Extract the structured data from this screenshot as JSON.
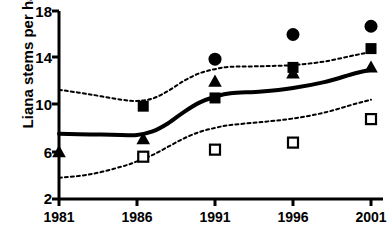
{
  "chart_data": {
    "type": "scatter",
    "title": "",
    "xlabel": "",
    "ylabel": "Liana stems per ha",
    "x": [
      1981,
      1986,
      1991,
      1996,
      2001
    ],
    "xtick_labels": [
      "1981",
      "1986",
      "1991",
      "1996",
      "2001"
    ],
    "ytick_labels": [
      "2",
      "6",
      "10",
      "14",
      "18"
    ],
    "yticks": [
      2,
      6,
      10,
      14,
      18
    ],
    "xlim": [
      1981,
      2001
    ],
    "ylim": [
      2,
      18
    ],
    "grid": false,
    "legend": "none",
    "series": [
      {
        "name": "filled-circle",
        "marker": "filled-circle",
        "color": "#000000",
        "points": [
          {
            "x": 1991,
            "y": 13.9
          },
          {
            "x": 1996,
            "y": 16.0
          },
          {
            "x": 2001,
            "y": 16.7
          }
        ]
      },
      {
        "name": "filled-square",
        "marker": "filled-square",
        "color": "#000000",
        "points": [
          {
            "x": 1986.4,
            "y": 9.9
          },
          {
            "x": 1991,
            "y": 10.6
          },
          {
            "x": 1996,
            "y": 13.2
          },
          {
            "x": 2001,
            "y": 14.8
          }
        ]
      },
      {
        "name": "filled-triangle",
        "marker": "filled-triangle",
        "color": "#000000",
        "points": [
          {
            "x": 1981,
            "y": 6.0
          },
          {
            "x": 1986.4,
            "y": 7.1
          },
          {
            "x": 1991,
            "y": 12.0
          },
          {
            "x": 1996,
            "y": 12.7
          },
          {
            "x": 2001,
            "y": 13.2
          }
        ]
      },
      {
        "name": "open-square",
        "marker": "open-square",
        "color": "#000000",
        "points": [
          {
            "x": 1986.4,
            "y": 5.6
          },
          {
            "x": 1991,
            "y": 6.2
          },
          {
            "x": 1996,
            "y": 6.8
          },
          {
            "x": 2001,
            "y": 8.8
          }
        ]
      }
    ],
    "trend_line": {
      "name": "fitted-trend",
      "style": "solid",
      "color": "#000000",
      "values": [
        {
          "x": 1981.0,
          "y": 7.55
        },
        {
          "x": 1983.0,
          "y": 7.5
        },
        {
          "x": 1985.0,
          "y": 7.45
        },
        {
          "x": 1986.0,
          "y": 7.45
        },
        {
          "x": 1987.0,
          "y": 7.75
        },
        {
          "x": 1988.0,
          "y": 8.45
        },
        {
          "x": 1989.0,
          "y": 9.4
        },
        {
          "x": 1990.0,
          "y": 10.2
        },
        {
          "x": 1991.0,
          "y": 10.7
        },
        {
          "x": 1992.0,
          "y": 11.0
        },
        {
          "x": 1994.0,
          "y": 11.15
        },
        {
          "x": 1996.0,
          "y": 11.45
        },
        {
          "x": 1998.0,
          "y": 11.95
        },
        {
          "x": 2000.0,
          "y": 12.7
        },
        {
          "x": 2001.0,
          "y": 13.0
        }
      ]
    },
    "confidence_bands": [
      {
        "name": "upper-confidence-band",
        "style": "dotted",
        "color": "#000000",
        "values": [
          {
            "x": 1981.0,
            "y": 11.3
          },
          {
            "x": 1983.0,
            "y": 10.9
          },
          {
            "x": 1985.0,
            "y": 10.45
          },
          {
            "x": 1986.0,
            "y": 10.35
          },
          {
            "x": 1987.0,
            "y": 10.55
          },
          {
            "x": 1988.0,
            "y": 11.2
          },
          {
            "x": 1989.0,
            "y": 12.05
          },
          {
            "x": 1990.0,
            "y": 12.7
          },
          {
            "x": 1991.0,
            "y": 13.05
          },
          {
            "x": 1992.0,
            "y": 13.25
          },
          {
            "x": 1994.0,
            "y": 13.3
          },
          {
            "x": 1996.0,
            "y": 13.4
          },
          {
            "x": 1998.0,
            "y": 13.7
          },
          {
            "x": 2000.0,
            "y": 14.25
          },
          {
            "x": 2001.0,
            "y": 14.5
          }
        ]
      },
      {
        "name": "lower-confidence-band",
        "style": "dotted",
        "color": "#000000",
        "values": [
          {
            "x": 1981.0,
            "y": 3.8
          },
          {
            "x": 1983.0,
            "y": 4.1
          },
          {
            "x": 1985.0,
            "y": 4.75
          },
          {
            "x": 1986.0,
            "y": 5.2
          },
          {
            "x": 1987.0,
            "y": 5.75
          },
          {
            "x": 1988.0,
            "y": 6.45
          },
          {
            "x": 1989.0,
            "y": 7.15
          },
          {
            "x": 1990.0,
            "y": 7.7
          },
          {
            "x": 1991.0,
            "y": 8.05
          },
          {
            "x": 1992.0,
            "y": 8.3
          },
          {
            "x": 1994.0,
            "y": 8.55
          },
          {
            "x": 1996.0,
            "y": 8.85
          },
          {
            "x": 1998.0,
            "y": 9.35
          },
          {
            "x": 2000.0,
            "y": 10.1
          },
          {
            "x": 2001.0,
            "y": 10.45
          }
        ]
      }
    ]
  }
}
